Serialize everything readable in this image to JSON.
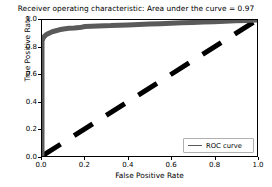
{
  "chart_data": {
    "type": "line",
    "title": "Receiver operating characteristic: Area under the curve = 0.97",
    "xlabel": "False Positive Rate",
    "ylabel": "True Positive Rate",
    "xlim": [
      0.0,
      1.0
    ],
    "ylim": [
      0.0,
      1.0
    ],
    "grid": false,
    "legend_position": "lower right",
    "xticks": [
      "0.0",
      "0.2",
      "0.4",
      "0.6",
      "0.8",
      "1.0"
    ],
    "xtick_values": [
      0.0,
      0.2,
      0.4,
      0.6,
      0.8,
      1.0
    ],
    "yticks": [
      "0.0",
      "0.2",
      "0.4",
      "0.6",
      "0.8",
      "1.0"
    ],
    "ytick_values": [
      0.0,
      0.2,
      0.4,
      0.6,
      0.8,
      1.0
    ],
    "auc": 0.97,
    "series": [
      {
        "name": "ROC curve",
        "color": "#5a5a5a",
        "linestyle": "solid",
        "x": [
          0.0,
          0.0,
          0.004,
          0.01,
          0.018,
          0.03,
          0.045,
          0.06,
          0.08,
          0.1,
          0.125,
          0.15,
          0.175,
          0.2,
          0.23,
          0.26,
          0.29,
          0.32,
          0.36,
          0.4,
          0.45,
          0.5,
          0.55,
          0.6,
          0.65,
          0.7,
          0.75,
          0.8,
          0.85,
          0.9,
          0.95,
          1.0
        ],
        "y": [
          0.0,
          0.845,
          0.862,
          0.878,
          0.89,
          0.901,
          0.912,
          0.919,
          0.928,
          0.934,
          0.939,
          0.941,
          0.944,
          0.952,
          0.954,
          0.956,
          0.958,
          0.959,
          0.962,
          0.964,
          0.967,
          0.97,
          0.973,
          0.976,
          0.979,
          0.982,
          0.985,
          0.988,
          0.991,
          0.994,
          0.997,
          1.0
        ]
      },
      {
        "name": "chance-diagonal",
        "color": "#000000",
        "linestyle": "dashed",
        "x": [
          0.0,
          1.0
        ],
        "y": [
          0.0,
          1.0
        ]
      }
    ]
  },
  "legend": {
    "entries": [
      {
        "label": "ROC curve",
        "color": "#5a5a5a"
      }
    ]
  },
  "colors": {
    "roc_line": "#5a5a5a",
    "diagonal": "#000000",
    "axis": "#000000",
    "background": "#ffffff",
    "legend_border": "#b0b0b0"
  }
}
